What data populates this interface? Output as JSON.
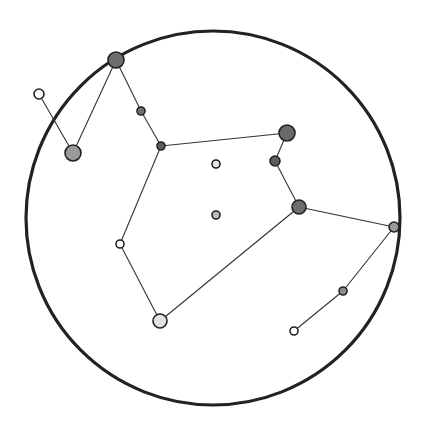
{
  "diagram": {
    "type": "constellation",
    "boundary": {
      "cx": 213,
      "cy": 218,
      "r": 187
    },
    "stars": [
      {
        "id": "A",
        "x": 116,
        "y": 60,
        "r": 8,
        "fill": "#6e6e6e"
      },
      {
        "id": "B",
        "x": 39,
        "y": 94,
        "r": 5,
        "fill": "#ffffff"
      },
      {
        "id": "C",
        "x": 73,
        "y": 153,
        "r": 8,
        "fill": "#9a9a9a"
      },
      {
        "id": "D",
        "x": 141,
        "y": 111,
        "r": 4,
        "fill": "#707070"
      },
      {
        "id": "E",
        "x": 161,
        "y": 146,
        "r": 4,
        "fill": "#5e5e5e"
      },
      {
        "id": "F",
        "x": 287,
        "y": 133,
        "r": 8,
        "fill": "#6a6a6a"
      },
      {
        "id": "G",
        "x": 275,
        "y": 161,
        "r": 5,
        "fill": "#5e5e5e"
      },
      {
        "id": "H",
        "x": 299,
        "y": 207,
        "r": 7,
        "fill": "#6e6e6e"
      },
      {
        "id": "I",
        "x": 394,
        "y": 227,
        "r": 5,
        "fill": "#9a9a9a"
      },
      {
        "id": "J",
        "x": 343,
        "y": 291,
        "r": 4,
        "fill": "#8c8c8c"
      },
      {
        "id": "K",
        "x": 294,
        "y": 331,
        "r": 4,
        "fill": "#ffffff"
      },
      {
        "id": "L",
        "x": 120,
        "y": 244,
        "r": 4,
        "fill": "#ffffff"
      },
      {
        "id": "M",
        "x": 160,
        "y": 321,
        "r": 7,
        "fill": "#e2e2e2"
      },
      {
        "id": "N",
        "x": 216,
        "y": 164,
        "r": 4,
        "fill": "#e6e6e6"
      },
      {
        "id": "O",
        "x": 216,
        "y": 215,
        "r": 4,
        "fill": "#bdbdbd"
      }
    ],
    "edges": [
      [
        "B",
        "C"
      ],
      [
        "C",
        "A"
      ],
      [
        "A",
        "D"
      ],
      [
        "D",
        "E"
      ],
      [
        "E",
        "F"
      ],
      [
        "F",
        "G"
      ],
      [
        "G",
        "H"
      ],
      [
        "H",
        "I"
      ],
      [
        "I",
        "J"
      ],
      [
        "J",
        "K"
      ],
      [
        "E",
        "L"
      ],
      [
        "L",
        "M"
      ],
      [
        "M",
        "H"
      ]
    ]
  }
}
